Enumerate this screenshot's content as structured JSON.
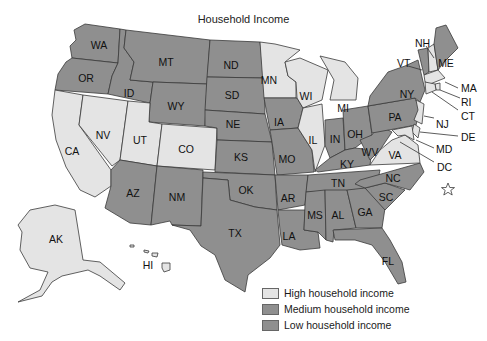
{
  "title": "Household Income",
  "colors": {
    "high": "#e4e4e4",
    "medium": "#8f8f8f",
    "low": "#8f8f8f",
    "border": "#3a3a3a",
    "dc_star": "#888888"
  },
  "legend": {
    "items": [
      {
        "key": "high",
        "label": "High household income"
      },
      {
        "key": "medium",
        "label": "Medium household income"
      },
      {
        "key": "low",
        "label": "Low household income"
      }
    ]
  },
  "states": {
    "WA": {
      "label": "WA",
      "category": "medium"
    },
    "OR": {
      "label": "OR",
      "category": "medium"
    },
    "CA": {
      "label": "CA",
      "category": "high"
    },
    "NV": {
      "label": "NV",
      "category": "high"
    },
    "ID": {
      "label": "ID",
      "category": "medium"
    },
    "MT": {
      "label": "MT",
      "category": "medium"
    },
    "WY": {
      "label": "WY",
      "category": "medium"
    },
    "UT": {
      "label": "UT",
      "category": "high"
    },
    "CO": {
      "label": "CO",
      "category": "high"
    },
    "AZ": {
      "label": "AZ",
      "category": "medium"
    },
    "NM": {
      "label": "NM",
      "category": "medium"
    },
    "ND": {
      "label": "ND",
      "category": "medium"
    },
    "SD": {
      "label": "SD",
      "category": "medium"
    },
    "NE": {
      "label": "NE",
      "category": "medium"
    },
    "KS": {
      "label": "KS",
      "category": "medium"
    },
    "OK": {
      "label": "OK",
      "category": "medium"
    },
    "TX": {
      "label": "TX",
      "category": "medium"
    },
    "MN": {
      "label": "MN",
      "category": "high"
    },
    "IA": {
      "label": "IA",
      "category": "medium"
    },
    "MO": {
      "label": "MO",
      "category": "medium"
    },
    "AR": {
      "label": "AR",
      "category": "low"
    },
    "LA": {
      "label": "LA",
      "category": "low"
    },
    "WI": {
      "label": "WI",
      "category": "high"
    },
    "IL": {
      "label": "IL",
      "category": "high"
    },
    "MI": {
      "label": "MI",
      "category": "high"
    },
    "IN": {
      "label": "IN",
      "category": "medium"
    },
    "OH": {
      "label": "OH",
      "category": "medium"
    },
    "KY": {
      "label": "KY",
      "category": "low"
    },
    "TN": {
      "label": "TN",
      "category": "low"
    },
    "MS": {
      "label": "MS",
      "category": "low"
    },
    "AL": {
      "label": "AL",
      "category": "low"
    },
    "GA": {
      "label": "GA",
      "category": "medium"
    },
    "FL": {
      "label": "FL",
      "category": "medium"
    },
    "SC": {
      "label": "SC",
      "category": "low"
    },
    "NC": {
      "label": "NC",
      "category": "medium"
    },
    "VA": {
      "label": "VA",
      "category": "high"
    },
    "WV": {
      "label": "WV",
      "category": "low"
    },
    "PA": {
      "label": "PA",
      "category": "medium"
    },
    "NY": {
      "label": "NY",
      "category": "medium"
    },
    "VT": {
      "label": "VT",
      "category": "medium"
    },
    "NH": {
      "label": "NH",
      "category": "high"
    },
    "ME": {
      "label": "ME",
      "category": "medium"
    },
    "MA": {
      "label": "MA",
      "category": "high"
    },
    "RI": {
      "label": "RI",
      "category": "high"
    },
    "CT": {
      "label": "CT",
      "category": "high"
    },
    "NJ": {
      "label": "NJ",
      "category": "high"
    },
    "DE": {
      "label": "DE",
      "category": "high"
    },
    "MD": {
      "label": "MD",
      "category": "high"
    },
    "DC": {
      "label": "DC",
      "category": "high"
    },
    "AK": {
      "label": "AK",
      "category": "high"
    },
    "HI": {
      "label": "HI",
      "category": "high"
    }
  }
}
